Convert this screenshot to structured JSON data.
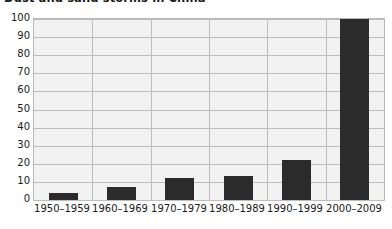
{
  "chart_data": {
    "type": "bar",
    "title": "Dust and sand storms in China",
    "xlabel": "",
    "ylabel": "",
    "categories": [
      "1950–1959",
      "1960–1969",
      "1970–1979",
      "1980–1989",
      "1990–1999",
      "2000–2009"
    ],
    "values": [
      4,
      7,
      12,
      13,
      22,
      100
    ],
    "ylim": [
      0,
      100
    ],
    "yticks": [
      0,
      10,
      20,
      30,
      40,
      50,
      60,
      70,
      80,
      90,
      100
    ],
    "ytick_labels": [
      "0",
      "10",
      "20",
      "30",
      "40",
      "50",
      "60",
      "70",
      "80",
      "90",
      "100"
    ],
    "grid": true,
    "legend": false,
    "bar_color": "#2b2b2b",
    "plot_background": "#f2f2f2",
    "gridline_color": "#bdbdbd",
    "axis_text_color": "#1a1a1a"
  }
}
